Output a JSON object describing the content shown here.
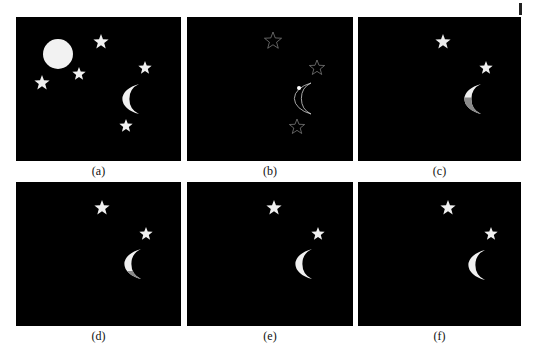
{
  "figure": {
    "background": "#ffffff",
    "panel_background": "#000000",
    "panels": [
      {
        "id": "a",
        "label": "(a)",
        "x": 16,
        "y": 17,
        "w": 165,
        "h": 144,
        "full_moon": {
          "cx": 42,
          "cy": 37,
          "r": 15,
          "fill": "#f2f2f2"
        },
        "crescent": {
          "x": 93,
          "y": 67,
          "w": 30,
          "h": 30,
          "style": "filled",
          "fill": "#f0f0f0",
          "shade_fill": null,
          "shade": "none"
        },
        "stars": [
          {
            "cx": 85,
            "cy": 25,
            "r": 8,
            "style": "filled",
            "fill": "#f0f0f0"
          },
          {
            "cx": 63,
            "cy": 57,
            "r": 7,
            "style": "filled",
            "fill": "#f0f0f0"
          },
          {
            "cx": 26,
            "cy": 66,
            "r": 8,
            "style": "filled",
            "fill": "#f0f0f0"
          },
          {
            "cx": 129,
            "cy": 51,
            "r": 7,
            "style": "filled",
            "fill": "#f0f0f0"
          },
          {
            "cx": 110,
            "cy": 109,
            "r": 7,
            "style": "filled",
            "fill": "#f0f0f0"
          }
        ]
      },
      {
        "id": "b",
        "label": "(b)",
        "x": 187,
        "y": 17,
        "w": 166,
        "h": 144,
        "full_moon": null,
        "crescent": {
          "x": 94,
          "y": 66,
          "w": 30,
          "h": 31,
          "style": "outline",
          "fill": "#cfcfcf",
          "shade_fill": null,
          "shade": "none"
        },
        "marker": {
          "cx": 112,
          "cy": 71,
          "r": 2,
          "fill": "#ffffff"
        },
        "stars": [
          {
            "cx": 86,
            "cy": 24,
            "r": 9,
            "style": "outline",
            "fill": "#8a8a8a"
          },
          {
            "cx": 130,
            "cy": 51,
            "r": 8,
            "style": "outline",
            "fill": "#8a8a8a"
          },
          {
            "cx": 110,
            "cy": 110,
            "r": 8,
            "style": "outline",
            "fill": "#8a8a8a"
          }
        ]
      },
      {
        "id": "c",
        "label": "(c)",
        "x": 358,
        "y": 17,
        "w": 163,
        "h": 144,
        "full_moon": null,
        "crescent": {
          "x": 93,
          "y": 67,
          "w": 30,
          "h": 30,
          "style": "filled",
          "fill": "#f0f0f0",
          "shade_fill": "#8a8a8a",
          "shade": "left-bottom"
        },
        "stars": [
          {
            "cx": 85,
            "cy": 25,
            "r": 8,
            "style": "filled",
            "fill": "#ececec"
          },
          {
            "cx": 128,
            "cy": 51,
            "r": 7,
            "style": "filled",
            "fill": "#f0f0f0"
          }
        ]
      },
      {
        "id": "d",
        "label": "(d)",
        "x": 16,
        "y": 182,
        "w": 165,
        "h": 144,
        "full_moon": null,
        "crescent": {
          "x": 95,
          "y": 67,
          "w": 30,
          "h": 30,
          "style": "filled",
          "fill": "#f0f0f0",
          "shade_fill": "#8a8a8a",
          "shade": "bottom"
        },
        "stars": [
          {
            "cx": 86,
            "cy": 26,
            "r": 8,
            "style": "filled",
            "fill": "#f0f0f0"
          },
          {
            "cx": 130,
            "cy": 52,
            "r": 7,
            "style": "filled",
            "fill": "#f0f0f0"
          }
        ]
      },
      {
        "id": "e",
        "label": "(e)",
        "x": 187,
        "y": 182,
        "w": 166,
        "h": 144,
        "full_moon": null,
        "crescent": {
          "x": 95,
          "y": 67,
          "w": 30,
          "h": 30,
          "style": "filled",
          "fill": "#f0f0f0",
          "shade_fill": null,
          "shade": "none"
        },
        "stars": [
          {
            "cx": 87,
            "cy": 26,
            "r": 8,
            "style": "filled",
            "fill": "#f0f0f0"
          },
          {
            "cx": 131,
            "cy": 52,
            "r": 7,
            "style": "filled",
            "fill": "#f0f0f0"
          }
        ]
      },
      {
        "id": "f",
        "label": "(f)",
        "x": 358,
        "y": 182,
        "w": 163,
        "h": 144,
        "full_moon": null,
        "crescent": {
          "x": 97,
          "y": 68,
          "w": 30,
          "h": 30,
          "style": "filled",
          "fill": "#f0f0f0",
          "shade_fill": null,
          "shade": "none"
        },
        "stars": [
          {
            "cx": 90,
            "cy": 26,
            "r": 8,
            "style": "filled",
            "fill": "#f0f0f0"
          },
          {
            "cx": 133,
            "cy": 52,
            "r": 7,
            "style": "filled",
            "fill": "#f0f0f0"
          }
        ]
      }
    ]
  }
}
